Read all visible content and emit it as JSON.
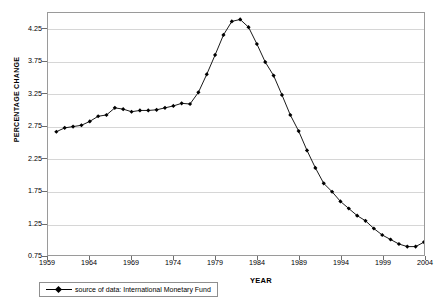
{
  "chart_data": {
    "type": "line",
    "title": "",
    "xlabel": "YEAR",
    "ylabel": "PERCENTAGE CHANGE",
    "grid": true,
    "legend_position": "bottom-left",
    "xlim": [
      1959,
      2004
    ],
    "ylim": [
      0.75,
      4.5
    ],
    "xticks": [
      1959,
      1964,
      1969,
      1974,
      1979,
      1984,
      1989,
      1994,
      1999,
      2004
    ],
    "yticks": [
      0.75,
      1.25,
      1.75,
      2.25,
      2.75,
      3.25,
      3.75,
      4.25
    ],
    "series": [
      {
        "name": "source of data: International Monetary Fund",
        "color": "#000000",
        "marker": "diamond",
        "x": [
          1960,
          1961,
          1962,
          1963,
          1964,
          1965,
          1966,
          1967,
          1968,
          1969,
          1970,
          1971,
          1972,
          1973,
          1974,
          1975,
          1976,
          1977,
          1978,
          1979,
          1980,
          1981,
          1982,
          1983,
          1984,
          1985,
          1986,
          1987,
          1988,
          1989,
          1990,
          1991,
          1992,
          1993,
          1994,
          1995,
          1996,
          1997,
          1998,
          1999,
          2000,
          2001,
          2002,
          2003,
          2004
        ],
        "values": [
          2.66,
          2.72,
          2.74,
          2.76,
          2.82,
          2.9,
          2.92,
          3.03,
          3.01,
          2.97,
          2.99,
          2.99,
          3.0,
          3.03,
          3.06,
          3.1,
          3.09,
          3.27,
          3.55,
          3.85,
          4.16,
          4.37,
          4.4,
          4.28,
          4.02,
          3.74,
          3.53,
          3.23,
          2.92,
          2.67,
          2.37,
          2.1,
          1.86,
          1.73,
          1.58,
          1.47,
          1.36,
          1.28,
          1.16,
          1.06,
          0.99,
          0.92,
          0.88,
          0.88,
          0.95
        ]
      }
    ]
  },
  "axes": {
    "y_title": "PERCENTAGE CHANGE",
    "x_title": "YEAR",
    "y_tick_labels": [
      "4.25",
      "3.75",
      "3.25",
      "2.75",
      "2.25",
      "1.75",
      "1.25",
      "0.75"
    ],
    "x_tick_labels": [
      "1959",
      "1964",
      "1969",
      "1974",
      "1979",
      "1984",
      "1989",
      "1994",
      "1999",
      "2004"
    ]
  },
  "legend": {
    "entries": [
      {
        "label": "source of data: International Monetary Fund",
        "marker": "diamond-marker",
        "color": "#000000"
      }
    ]
  },
  "colors": {
    "line": "#000000",
    "grid": "#d6d6d6",
    "frame": "#9a9a9a",
    "text": "#000000",
    "background": "#ffffff"
  }
}
